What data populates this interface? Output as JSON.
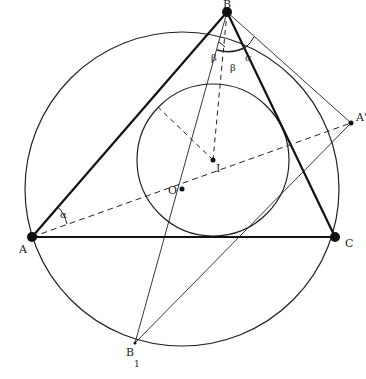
{
  "diagram": {
    "type": "geometry",
    "points": {
      "A": {
        "label": "A",
        "x": 32,
        "y": 237
      },
      "B": {
        "label": "B",
        "x": 227,
        "y": 12
      },
      "C": {
        "label": "C",
        "x": 335,
        "y": 237
      },
      "A_prime": {
        "label": "A'",
        "x": 351,
        "y": 123
      },
      "B1": {
        "label": "B",
        "sub": "1",
        "x": 135,
        "y": 343
      },
      "O": {
        "label": "O",
        "x": 182,
        "y": 189
      },
      "I": {
        "label": "I",
        "x": 213,
        "y": 160
      }
    },
    "circles": {
      "circumcircle": {
        "cx": 182,
        "cy": 189,
        "r": 157
      },
      "incircle": {
        "cx": 213,
        "cy": 160,
        "r": 76
      }
    },
    "angle_labels": {
      "alpha_A": "α",
      "alpha_B": "α",
      "beta_left": "β",
      "beta_right": "β"
    }
  }
}
